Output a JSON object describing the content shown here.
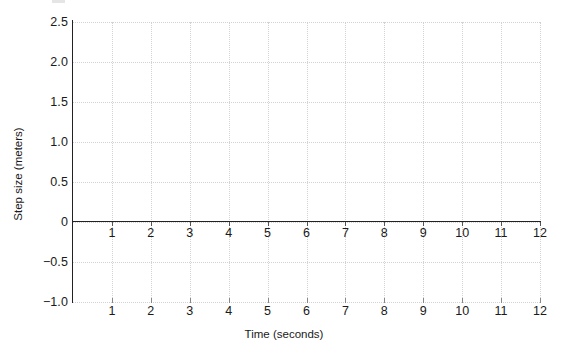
{
  "chart_data": {
    "type": "line",
    "title": "",
    "xlabel": "Time (seconds)",
    "ylabel": "Step size (meters)",
    "xlim": [
      0,
      12
    ],
    "ylim": [
      -1.0,
      2.5
    ],
    "grid": true,
    "legend": null,
    "series": [],
    "values": [],
    "x": [],
    "annotations": [],
    "x_tick_labels": [
      "1",
      "2",
      "3",
      "4",
      "5",
      "6",
      "7",
      "8",
      "9",
      "10",
      "11",
      "12"
    ],
    "x_tick_values": [
      1,
      2,
      3,
      4,
      5,
      6,
      7,
      8,
      9,
      10,
      11,
      12
    ],
    "x_tick_labels_bottom": [
      "1",
      "2",
      "3",
      "4",
      "5",
      "6",
      "7",
      "8",
      "9",
      "10",
      "11",
      "12"
    ],
    "y_tick_labels": [
      "2.5",
      "2.0",
      "1.5",
      "1.0",
      "0.5",
      "0",
      "−0.5",
      "−1.0"
    ],
    "y_tick_values": [
      2.5,
      2.0,
      1.5,
      1.0,
      0.5,
      0,
      -0.5,
      -1.0
    ],
    "colors": {
      "axis": "#222222",
      "grid": "#d2d2d2",
      "text": "#1a1a1a",
      "background": "#ffffff"
    }
  }
}
